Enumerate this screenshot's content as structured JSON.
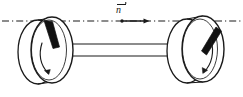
{
  "figure": {
    "background_color": "#ffffff",
    "stroke_color": "#1a1a1a",
    "blade_fill_color": "#111111",
    "width": 243,
    "height": 97
  },
  "labels": {
    "axis_vector": "n",
    "axis_vector_has_overbar_arrow": true
  },
  "axis": {
    "name": "rotation-axis",
    "style": "dash-dot",
    "y": 21,
    "x_start": 2,
    "x_end": 241,
    "direction_arrow": {
      "dot_x": 122,
      "tip_x": 148,
      "y": 21
    }
  },
  "left_disc": {
    "name": "left-disc",
    "center_x": 52,
    "center_y": 50,
    "rx": 21,
    "ry": 33,
    "rim_offset_x": -14,
    "blade_angle_deg": 62,
    "rotation_arrow_direction": "downward"
  },
  "right_disc": {
    "name": "right-disc",
    "center_x": 203,
    "center_y": 49,
    "rx": 21,
    "ry": 33,
    "rim_offset_x": -16,
    "blade_angle_deg": -62,
    "rotation_arrow_direction": "downward"
  },
  "axle": {
    "name": "connecting-axle",
    "x_start": 58,
    "x_end": 195,
    "y_top": 44,
    "y_bottom": 56
  },
  "colors": {
    "stroke": "#1a1a1a",
    "fill": "#ffffff",
    "blade": "#111111"
  }
}
